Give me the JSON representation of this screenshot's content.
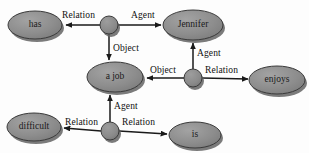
{
  "diagram": {
    "type": "semantic-network",
    "background_color": "#fdfdfd",
    "concept_fill": "#8c8c8c",
    "concept_stroke": "#3a3a3a",
    "relation_fill": "#8c8c8c",
    "relation_stroke": "#3a3a3a",
    "shadow_color": "#5a5a5a",
    "edge_color": "#1a1a1a",
    "text_color": "#111111",
    "concept_nodes": [
      {
        "id": "has",
        "label": "has",
        "cx": 35,
        "cy": 25,
        "rx": 27,
        "ry": 14
      },
      {
        "id": "jennifer",
        "label": "Jennifer",
        "cx": 193,
        "cy": 25,
        "rx": 30,
        "ry": 15
      },
      {
        "id": "a_job",
        "label": "a job",
        "cx": 115,
        "cy": 77,
        "rx": 28,
        "ry": 15
      },
      {
        "id": "enjoys",
        "label": "enjoys",
        "cx": 277,
        "cy": 80,
        "rx": 28,
        "ry": 14
      },
      {
        "id": "difficult",
        "label": "difficult",
        "cx": 34,
        "cy": 127,
        "rx": 27,
        "ry": 14
      },
      {
        "id": "is",
        "label": "is",
        "cx": 195,
        "cy": 135,
        "rx": 26,
        "ry": 13
      }
    ],
    "relation_nodes": [
      {
        "id": "r_top",
        "cx": 109,
        "cy": 25,
        "r": 9
      },
      {
        "id": "r_middle",
        "cx": 193,
        "cy": 78,
        "r": 9
      },
      {
        "id": "r_bottom",
        "cx": 110,
        "cy": 131,
        "r": 9
      }
    ],
    "edges": [
      {
        "from": "r_top",
        "to": "has",
        "label": "Relation",
        "label_x": 62,
        "label_y": 11,
        "direction": "left"
      },
      {
        "from": "r_top",
        "to": "jennifer",
        "label": "Agent",
        "label_x": 131,
        "label_y": 11,
        "direction": "right"
      },
      {
        "from": "r_top",
        "to": "a_job",
        "label": "Object",
        "label_x": 113,
        "label_y": 44,
        "direction": "down"
      },
      {
        "from": "r_middle",
        "to": "jennifer",
        "label": "Agent",
        "label_x": 197,
        "label_y": 49,
        "direction": "up"
      },
      {
        "from": "r_middle",
        "to": "a_job",
        "label": "Object",
        "label_x": 150,
        "label_y": 66,
        "direction": "left"
      },
      {
        "from": "r_middle",
        "to": "enjoys",
        "label": "Relation",
        "label_x": 205,
        "label_y": 66,
        "direction": "right"
      },
      {
        "from": "r_bottom",
        "to": "a_job",
        "label": "Agent",
        "label_x": 114,
        "label_y": 102,
        "direction": "up"
      },
      {
        "from": "r_bottom",
        "to": "difficult",
        "label": "Relation",
        "label_x": 65,
        "label_y": 118,
        "direction": "left"
      },
      {
        "from": "r_bottom",
        "to": "is",
        "label": "Relation",
        "label_x": 122,
        "label_y": 118,
        "direction": "right"
      }
    ]
  }
}
